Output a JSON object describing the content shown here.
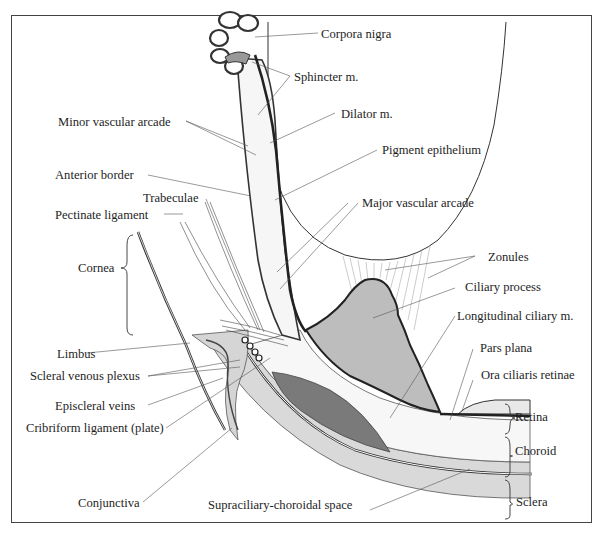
{
  "figure": {
    "type": "anatomical cross-section diagram",
    "colors": {
      "frame": "#444444",
      "ciliary_process_fill": "#bdbdbd",
      "muscle_fill": "#7a7a7a",
      "sclera_fill": "#d9d9d9",
      "stroma_fill": "#f4f4f4",
      "pigment_line": "#2a2a2a"
    }
  },
  "labels": {
    "corpora_nigra": "Corpora nigra",
    "sphincter": "Sphincter m.",
    "minor_vascular_arcade": "Minor vascular arcade",
    "dilator": "Dilator m.",
    "pigment_epithelium": "Pigment epithelium",
    "anterior_border": "Anterior border",
    "trabeculae": "Trabeculae",
    "major_vascular_arcade": "Major vascular arcade",
    "pectinate_ligament": "Pectinate ligament",
    "cornea": "Cornea",
    "zonules": "Zonules",
    "ciliary_process": "Ciliary process",
    "longitudinal_ciliary": "Longitudinal ciliary m.",
    "limbus": "Limbus",
    "pars_plana": "Pars plana",
    "scleral_venous_plexus": "Scleral venous plexus",
    "ora_ciliaris_retinae": "Ora ciliaris retinae",
    "episcleral_veins": "Episcleral veins",
    "retina": "Retina",
    "cribriform_ligament": "Cribriform ligament (plate)",
    "choroid": "Choroid",
    "conjunctiva": "Conjunctiva",
    "supraciliary_choroidal_space": "Supraciliary-choroidal space",
    "sclera": "Sclera"
  }
}
